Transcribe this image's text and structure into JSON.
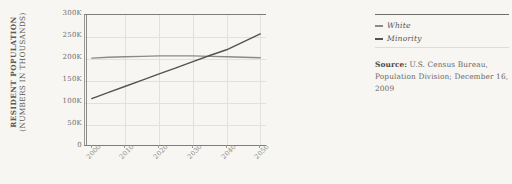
{
  "chart_data": {
    "type": "line",
    "title": "",
    "xlabel": "",
    "ylabel": "RESIDENT POPULATION (NUMBERS IN THOUSANDS)",
    "ylabel_line1": "RESIDENT POPULATION",
    "ylabel_line2": "(NUMBERS IN THOUSANDS)",
    "x": [
      2000,
      2005,
      2010,
      2015,
      2020,
      2025,
      2030,
      2035,
      2040,
      2045,
      2050
    ],
    "xtick_labels": [
      "2000",
      "2005",
      "2010",
      "2015",
      "2020",
      "2025",
      "2030",
      "2035",
      "2040",
      "2045",
      "2050"
    ],
    "xlim": [
      1998,
      2052
    ],
    "ylim": [
      0,
      300
    ],
    "ytick_values": [
      0,
      50,
      100,
      150,
      200,
      250,
      300
    ],
    "ytick_labels": [
      "0",
      "50K",
      "100K",
      "150K",
      "200K",
      "250K",
      "300K"
    ],
    "grid": true,
    "legend_position": "right",
    "series": [
      {
        "name": "White",
        "color": "#8c8a86",
        "values": [
          202,
          204,
          205,
          206,
          207,
          207,
          207,
          206,
          205,
          204,
          203
        ]
      },
      {
        "name": "Minority",
        "color": "#555350",
        "values": [
          110,
          124,
          138,
          152,
          166,
          180,
          194,
          208,
          221,
          239,
          257
        ]
      }
    ]
  },
  "legend": {
    "items": [
      {
        "label": "White",
        "color": "#8c8a86"
      },
      {
        "label": "Minority",
        "color": "#555350"
      }
    ]
  },
  "source": {
    "label": "Source:",
    "text": " U.S. Census Bureau, Population Division; December 16, 2009"
  },
  "colors": {
    "background": "#f7f6f3",
    "axis": "#9a9894",
    "grid": "#e2e0dc",
    "text": "#6b6965",
    "white_series": "#8c8a86",
    "minority_series": "#555350"
  }
}
